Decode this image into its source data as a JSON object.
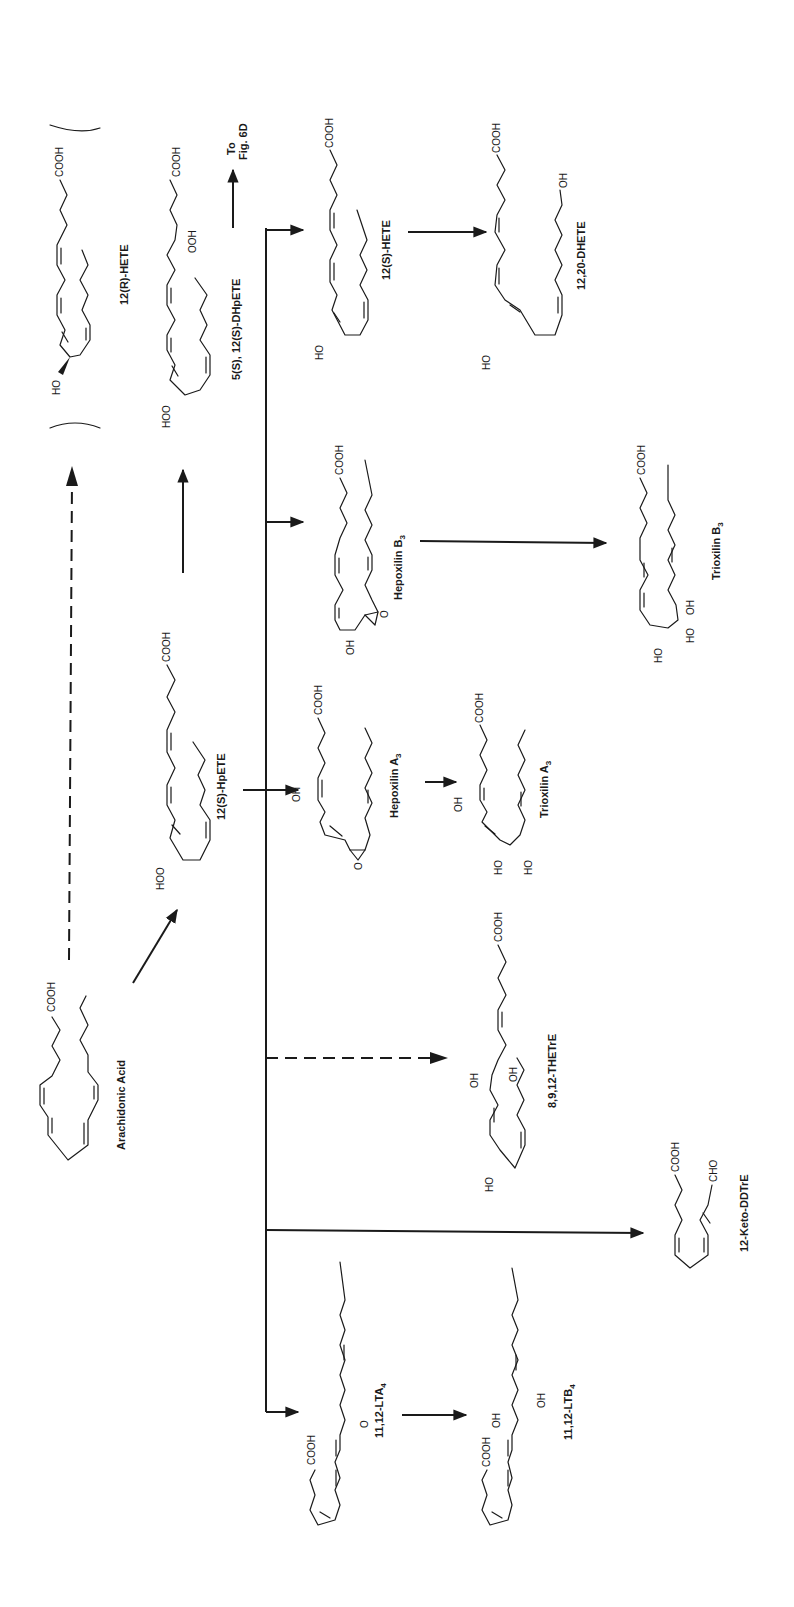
{
  "figure": {
    "orientation": "rotated 90deg clockwise (text reads bottom-to-top)",
    "ink_color": "#1a1a1a",
    "background": "#ffffff"
  },
  "compounds": [
    {
      "id": "arachidonic_acid",
      "name": "Arachidonic Acid",
      "groups": [
        "COOH"
      ]
    },
    {
      "id": "hpete_12s",
      "name": "12(S)-HpETE",
      "groups": [
        "COOH",
        "HOO"
      ]
    },
    {
      "id": "hete_12r",
      "name": "12(R)-HETE",
      "groups": [
        "COOH",
        "HO"
      ],
      "bracketed": true
    },
    {
      "id": "dhpete",
      "name": "5(S), 12(S)-DHpETE",
      "groups": [
        "COOH",
        "OOH",
        "HOO"
      ]
    },
    {
      "id": "to_fig",
      "name": "To Fig. 6D",
      "line1": "To",
      "line2": "Fig. 6D"
    },
    {
      "id": "hete_12s",
      "name": "12(S)-HETE",
      "groups": [
        "COOH",
        "HO"
      ]
    },
    {
      "id": "dhete",
      "name": "12,20-DHETE",
      "groups": [
        "COOH",
        "OH",
        "HO"
      ]
    },
    {
      "id": "hepoxilin_b3",
      "name": "Hepoxilin B",
      "subscript": "3",
      "groups": [
        "COOH",
        "OH",
        "O"
      ]
    },
    {
      "id": "trioxilin_b3",
      "name": "Trioxilin B",
      "subscript": "3",
      "groups": [
        "COOH",
        "HO",
        "HO",
        "OH"
      ]
    },
    {
      "id": "hepoxilin_a3",
      "name": "Hepoxilin A",
      "subscript": "3",
      "groups": [
        "COOH",
        "OH",
        "O"
      ]
    },
    {
      "id": "trioxilin_a3",
      "name": "Trioxilin A",
      "subscript": "3",
      "groups": [
        "COOH",
        "OH",
        "HO",
        "HO"
      ]
    },
    {
      "id": "thetre",
      "name": "8,9,12-THETrE",
      "groups": [
        "COOH",
        "OH",
        "OH",
        "HO"
      ]
    },
    {
      "id": "keto_ddtre",
      "name": "12-Keto-DDTrE",
      "groups": [
        "COOH",
        "CHO"
      ]
    },
    {
      "id": "lta4",
      "name": "11,12-LTA",
      "subscript": "4",
      "groups": [
        "COOH",
        "O"
      ]
    },
    {
      "id": "ltb4",
      "name": "11,12-LTB",
      "subscript": "4",
      "groups": [
        "COOH",
        "OH",
        "OH"
      ]
    }
  ],
  "arrows": [
    {
      "from": "Arachidonic Acid",
      "to": "12(S)-HpETE",
      "style": "solid"
    },
    {
      "from": "Arachidonic Acid",
      "to": "12(R)-HETE",
      "style": "dashed"
    },
    {
      "from": "12(S)-HpETE",
      "to": "5(S), 12(S)-DHpETE",
      "style": "solid"
    },
    {
      "from": "5(S), 12(S)-DHpETE",
      "to": "To Fig. 6D",
      "style": "solid"
    },
    {
      "from": "12(S)-HpETE",
      "to": "Hepoxilin A3",
      "style": "solid"
    },
    {
      "from": "12(S)-HpETE",
      "to": "12(S)-HETE",
      "style": "solid"
    },
    {
      "from": "12(S)-HETE",
      "to": "12,20-DHETE",
      "style": "solid"
    },
    {
      "from": "12(S)-HpETE",
      "to": "Hepoxilin B3",
      "style": "solid"
    },
    {
      "from": "Hepoxilin B3",
      "to": "Trioxilin B3",
      "style": "solid"
    },
    {
      "from": "Hepoxilin A3",
      "to": "Trioxilin A3",
      "style": "solid"
    },
    {
      "from": "12(S)-HpETE",
      "to": "8,9,12-THETrE",
      "style": "dashed"
    },
    {
      "from": "12(S)-HpETE",
      "to": "12-Keto-DDTrE",
      "style": "solid"
    },
    {
      "from": "12(S)-HpETE",
      "to": "11,12-LTA4",
      "style": "solid"
    },
    {
      "from": "11,12-LTA4",
      "to": "11,12-LTB4",
      "style": "solid"
    }
  ],
  "labels": {
    "arachidonic_acid": "Arachidonic Acid",
    "hpete_12s": "12(S)-HpETE",
    "hete_12r": "12(R)-HETE",
    "dhpete": "5(S), 12(S)-DHpETE",
    "to_fig_1": "To",
    "to_fig_2": "Fig. 6D",
    "hete_12s": "12(S)-HETE",
    "dhete": "12,20-DHETE",
    "hepoxilin_b3": "Hepoxilin B",
    "trioxilin_b3": "Trioxilin B",
    "hepoxilin_a3": "Hepoxilin A",
    "trioxilin_a3": "Trioxilin A",
    "thetre": "8,9,12-THETrE",
    "keto_ddtre": "12-Keto-DDTrE",
    "lta4": "11,12-LTA",
    "ltb4": "11,12-LTB",
    "sub3": "3",
    "sub4": "4"
  },
  "groups": {
    "cooh": "COOH",
    "hoo": "HOO",
    "ooh": "OOH",
    "ho": "HO",
    "oh": "OH",
    "o": "O",
    "cho": "CHO"
  }
}
